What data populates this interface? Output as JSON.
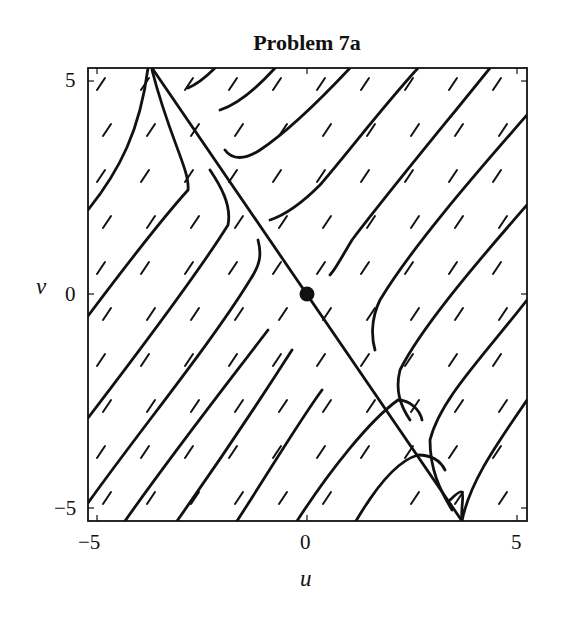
{
  "chart_data": {
    "type": "phase-portrait",
    "title": "Problem 7a",
    "xlabel": "u",
    "ylabel": "v",
    "xlim": [
      -5.2,
      5.2
    ],
    "ylim": [
      -5.2,
      5.2
    ],
    "xticks": [
      "-5",
      "0",
      "5"
    ],
    "yticks": [
      "5",
      "0",
      "-5"
    ],
    "grid": false,
    "equilibrium": {
      "u": 0,
      "v": 0,
      "type": "saddle"
    },
    "separatrix": {
      "from": [
        -3.6,
        5.2
      ],
      "to": [
        3.7,
        -5.2
      ],
      "description": "straight-line trajectory through origin"
    },
    "trajectory_direction": "parallel lines with positive slope, direction field arrows point up-right",
    "colors": {
      "line": "#111111",
      "background": "#ffffff"
    }
  },
  "labels": {
    "title": "Problem 7a",
    "x_axis": "u",
    "y_axis": "v",
    "x_tick_min": "−5",
    "x_tick_mid": "0",
    "x_tick_max": "5",
    "y_tick_max": "5",
    "y_tick_mid": "0",
    "y_tick_min": "−5"
  }
}
